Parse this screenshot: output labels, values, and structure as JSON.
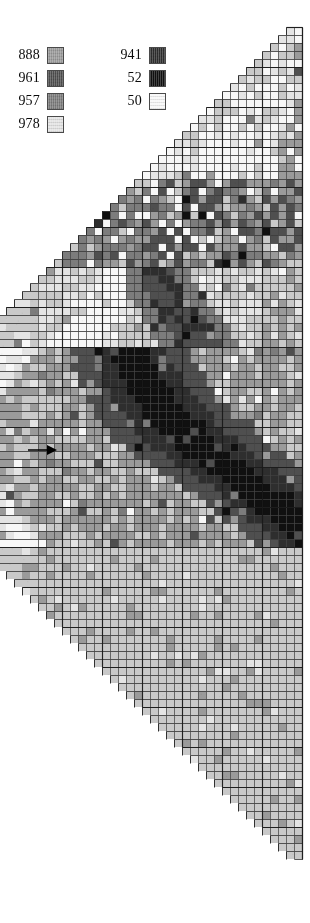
{
  "figure": {
    "type": "triangular-matrix-heatmap",
    "width": 310,
    "height": 923,
    "background": "#ffffff"
  },
  "legend": {
    "title": "",
    "columns": [
      {
        "name": "legend-column-left",
        "entries": [
          {
            "label": "888",
            "color": "#9a9a9a"
          },
          {
            "label": "961",
            "color": "#4f4f4f"
          },
          {
            "label": "957",
            "color": "#7c7c7c"
          },
          {
            "label": "978",
            "color": "#e4e4e4"
          }
        ]
      },
      {
        "name": "legend-column-right",
        "entries": [
          {
            "label": "941",
            "color": "#2e2e2e"
          },
          {
            "label": "52",
            "color": "#101010"
          },
          {
            "label": "50",
            "color": "#f7f7f7"
          }
        ]
      }
    ]
  },
  "arrow": {
    "name": "row-pointer-arrow",
    "label": "",
    "direction": "right",
    "x": 28,
    "y": 443,
    "points_to_row": 50
  },
  "chart_data": {
    "type": "heatmap",
    "title": "",
    "xlabel": "",
    "ylabel": "",
    "orientation": "triangular-rotated",
    "grid": true,
    "legend_position": "top-left",
    "cell_size": 8.0,
    "n_rows": 104,
    "apex": {
      "x": 302,
      "y": 27
    },
    "bottom_apex": {
      "x": 302,
      "y": 866
    },
    "left_extent_x": 53,
    "major_gridline_every": 5,
    "palette": [
      "#f7f7f7",
      "#e4e4e4",
      "#c9c9c9",
      "#9a9a9a",
      "#7c7c7c",
      "#4f4f4f",
      "#2e2e2e",
      "#101010"
    ],
    "levels": [
      {
        "index": 0,
        "name": "50",
        "color": "#f7f7f7"
      },
      {
        "index": 1,
        "name": "978",
        "color": "#e4e4e4"
      },
      {
        "index": 2,
        "name": "light-gray",
        "color": "#c9c9c9"
      },
      {
        "index": 3,
        "name": "888",
        "color": "#9a9a9a"
      },
      {
        "index": 4,
        "name": "957",
        "color": "#7c7c7c"
      },
      {
        "index": 5,
        "name": "961",
        "color": "#4f4f4f"
      },
      {
        "index": 6,
        "name": "941",
        "color": "#2e2e2e"
      },
      {
        "index": 7,
        "name": "52",
        "color": "#101010"
      }
    ],
    "structure_notes": [
      "Dense dark diagonal block around rows 48-62 near the right side",
      "Light (near-white) vertical streaks in upper-middle region",
      "Dark horizontal bands around rows 36-44",
      "Lower half (rows 70-104) is uniform mid-light gray"
    ],
    "seed": 20250411
  }
}
